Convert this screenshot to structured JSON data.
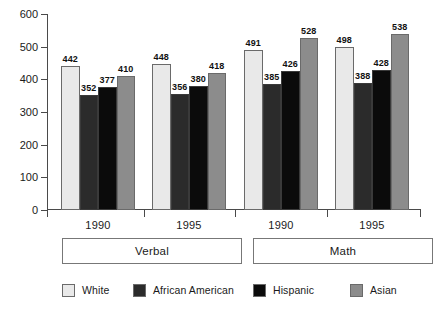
{
  "chart_data": {
    "type": "bar",
    "title": "",
    "subtitle": "",
    "xlabel": "",
    "ylabel": "",
    "ylim": [
      0,
      600
    ],
    "y_ticks": [
      0,
      100,
      200,
      300,
      400,
      500,
      600
    ],
    "grid": false,
    "legend_position": "bottom",
    "categories": [
      "1990",
      "1995",
      "1990",
      "1995"
    ],
    "group_labels": [
      "Verbal",
      "Math"
    ],
    "series": [
      {
        "name": "White",
        "color": "#e9e9e9",
        "values": [
          442,
          448,
          491,
          498
        ]
      },
      {
        "name": "African American",
        "color": "#2b2b2b",
        "values": [
          352,
          356,
          385,
          388
        ]
      },
      {
        "name": "Hispanic",
        "color": "#0b0b0b",
        "values": [
          377,
          380,
          426,
          428
        ]
      },
      {
        "name": "Asian",
        "color": "#8c8c8c",
        "values": [
          410,
          418,
          528,
          538
        ]
      }
    ]
  },
  "axis": {
    "y_tick_labels": [
      "600",
      "500",
      "400",
      "300",
      "200",
      "100",
      "0"
    ]
  },
  "groups": [
    {
      "year": "1990",
      "section": "Verbal"
    },
    {
      "year": "1995",
      "section": "Verbal"
    },
    {
      "year": "1990",
      "section": "Math"
    },
    {
      "year": "1995",
      "section": "Math"
    }
  ],
  "sections": [
    {
      "label": "Verbal"
    },
    {
      "label": "Math"
    }
  ],
  "legend": {
    "items": [
      {
        "label": "White",
        "color": "#e9e9e9"
      },
      {
        "label": "African American",
        "color": "#2b2b2b"
      },
      {
        "label": "Hispanic",
        "color": "#0b0b0b"
      },
      {
        "label": "Asian",
        "color": "#8c8c8c"
      }
    ]
  },
  "values_flat": {
    "verbal_1990": {
      "white": "442",
      "african_american": "352",
      "hispanic": "377",
      "asian": "410"
    },
    "verbal_1995": {
      "white": "448",
      "african_american": "356",
      "hispanic": "380",
      "asian": "418"
    },
    "math_1990": {
      "white": "491",
      "african_american": "385",
      "hispanic": "426",
      "asian": "528"
    },
    "math_1995": {
      "white": "498",
      "african_american": "388",
      "hispanic": "428",
      "asian": "538"
    }
  }
}
